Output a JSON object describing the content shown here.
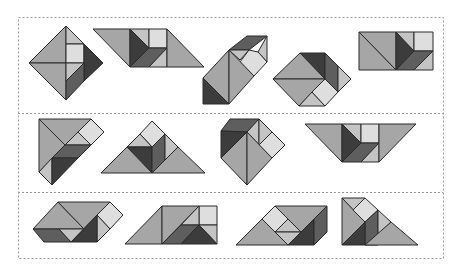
{
  "colors": {
    "background": "#ffffff",
    "frame": "#9a9a9a",
    "outline": "#2a2a2a",
    "mid": "#a6a6a6",
    "light": "#c4c4c4",
    "pale": "#dedede",
    "dark": "#3c3c3c",
    "darkmid": "#5e5e5e"
  },
  "frame": {
    "outer": {
      "x": 18,
      "y": 17,
      "w": 425,
      "h": 241
    },
    "dividers_y": [
      113,
      192
    ]
  },
  "rows": [
    {
      "label": "row-1",
      "figures": [
        {
          "name": "square-diamond",
          "pieces": [
            {
              "c": "mid",
              "p": "29,63 66,26 66,63"
            },
            {
              "c": "mid",
              "p": "29,63 66,63 66,100"
            },
            {
              "c": "light",
              "p": "66,26 84,44 66,44"
            },
            {
              "c": "pale",
              "p": "66,44 84,44 84,63 66,63"
            },
            {
              "c": "dark",
              "p": "84,44 103,63 84,81"
            },
            {
              "c": "light",
              "p": "66,63 84,63 66,81"
            },
            {
              "c": "darkmid",
              "p": "66,81 84,63 84,81 66,100"
            }
          ]
        },
        {
          "name": "parallelogram-wide",
          "pieces": [
            {
              "c": "mid",
              "p": "93,29 130,29 130,67"
            },
            {
              "c": "dark",
              "p": "130,29 149,48 130,67"
            },
            {
              "c": "light",
              "p": "130,29 149,29 149,48"
            },
            {
              "c": "pale",
              "p": "149,29 167,29 167,48 149,48"
            },
            {
              "c": "darkmid",
              "p": "149,48 167,48 149,67 130,67"
            },
            {
              "c": "light",
              "p": "167,48 167,67 149,67"
            },
            {
              "c": "mid",
              "p": "167,29 204,67 167,67"
            }
          ]
        },
        {
          "name": "hexagon-tilted",
          "pieces": [
            {
              "c": "darkmid",
              "p": "229,50 247,36 267,36 249,50"
            },
            {
              "c": "light",
              "p": "267,36 267,62 258,52"
            },
            {
              "c": "light",
              "p": "229,50 249,50 240,60"
            },
            {
              "c": "pale",
              "p": "249,50 258,52 267,62 254,76 240,62"
            },
            {
              "c": "mid",
              "p": "229,50 229,104 203,78"
            },
            {
              "c": "mid",
              "p": "229,50 254,76 229,104"
            },
            {
              "c": "dark",
              "p": "203,78 203,104 229,104"
            }
          ]
        },
        {
          "name": "hexagon-flat",
          "pieces": [
            {
              "c": "dark",
              "p": "300,53 325,53 325,79"
            },
            {
              "c": "mid",
              "p": "300,53 325,79 273,79"
            },
            {
              "c": "darkmid",
              "p": "325,53 338,66 338,92 325,79"
            },
            {
              "c": "light",
              "p": "338,66 351,79 338,92"
            },
            {
              "c": "mid",
              "p": "273,79 325,79 299,106"
            },
            {
              "c": "light",
              "p": "299,106 312,92 325,106"
            },
            {
              "c": "pale",
              "p": "312,92 325,79 338,92 325,106"
            }
          ]
        },
        {
          "name": "rectangle",
          "pieces": [
            {
              "c": "mid",
              "p": "359,32 396,32 396,70"
            },
            {
              "c": "mid",
              "p": "359,32 396,70 359,70"
            },
            {
              "c": "dark",
              "p": "396,32 414,51 396,70"
            },
            {
              "c": "light",
              "p": "396,32 414,32 414,51"
            },
            {
              "c": "pale",
              "p": "414,32 433,32 433,51 414,51"
            },
            {
              "c": "darkmid",
              "p": "414,51 433,51 414,70 396,70"
            },
            {
              "c": "light",
              "p": "433,51 433,70 414,70"
            }
          ]
        }
      ]
    },
    {
      "label": "row-2",
      "figures": [
        {
          "name": "kite-left",
          "pieces": [
            {
              "c": "mid",
              "p": "39,119 91,119 65,145"
            },
            {
              "c": "mid",
              "p": "39,119 65,145 39,172"
            },
            {
              "c": "pale",
              "p": "91,119 104,132 91,145 78,132"
            },
            {
              "c": "light",
              "p": "65,145 78,132 91,145"
            },
            {
              "c": "darkmid",
              "p": "65,145 91,145 78,158 52,158"
            },
            {
              "c": "light",
              "p": "39,172 52,158 52,185"
            },
            {
              "c": "dark",
              "p": "52,158 78,158 52,185"
            }
          ]
        },
        {
          "name": "triangle-house",
          "pieces": [
            {
              "c": "pale",
              "p": "152,121 165,134 152,147 140,134"
            },
            {
              "c": "light",
              "p": "127,147 140,134 152,147"
            },
            {
              "c": "dark",
              "p": "127,147 152,147 152,173"
            },
            {
              "c": "darkmid",
              "p": "152,147 165,134 165,160 152,173"
            },
            {
              "c": "light",
              "p": "165,134 178,147 165,160"
            },
            {
              "c": "mid",
              "p": "101,173 127,147 152,173"
            },
            {
              "c": "mid",
              "p": "152,173 178,147 205,173"
            }
          ]
        },
        {
          "name": "pentagon-gem",
          "pieces": [
            {
              "c": "darkmid",
              "p": "221,131 230,119 259,119 247,132"
            },
            {
              "c": "dark",
              "p": "221,131 247,132 221,158"
            },
            {
              "c": "light",
              "p": "259,119 259,145 247,132"
            },
            {
              "c": "light",
              "p": "259,119 272,132 259,145"
            },
            {
              "c": "pale",
              "p": "259,145 272,132 285,145 272,158"
            },
            {
              "c": "mid",
              "p": "221,158 247,132 247,185"
            },
            {
              "c": "mid",
              "p": "247,132 272,158 247,185"
            }
          ]
        },
        {
          "name": "trapezoid-inverted",
          "pieces": [
            {
              "c": "mid",
              "p": "305,124 342,124 342,162"
            },
            {
              "c": "dark",
              "p": "342,124 361,143 342,162"
            },
            {
              "c": "light",
              "p": "342,124 361,124 361,143"
            },
            {
              "c": "pale",
              "p": "361,124 379,124 379,143 361,143"
            },
            {
              "c": "darkmid",
              "p": "361,143 379,143 361,162 342,162"
            },
            {
              "c": "light",
              "p": "379,143 379,162 361,162"
            },
            {
              "c": "mid",
              "p": "379,124 416,124 379,162"
            }
          ]
        }
      ]
    },
    {
      "label": "row-3",
      "figures": [
        {
          "name": "boat-hexagon",
          "pieces": [
            {
              "c": "mid",
              "p": "33,229 58,202 84,229"
            },
            {
              "c": "mid",
              "p": "58,202 110,202 84,229"
            },
            {
              "c": "pale",
              "p": "110,202 123,215 110,229 97,215"
            },
            {
              "c": "light",
              "p": "97,215 110,229 97,242"
            },
            {
              "c": "darkmid",
              "p": "33,229 59,229 71,242 44,242"
            },
            {
              "c": "light",
              "p": "59,229 84,229 71,242"
            },
            {
              "c": "dark",
              "p": "71,242 97,215 97,242"
            }
          ]
        },
        {
          "name": "trapezoid-right",
          "pieces": [
            {
              "c": "mid",
              "p": "125,244 162,206 162,244"
            },
            {
              "c": "mid",
              "p": "162,206 199,206 162,244"
            },
            {
              "c": "pale",
              "p": "199,206 217,206 217,225 199,225"
            },
            {
              "c": "light",
              "p": "181,225 199,206 199,225"
            },
            {
              "c": "darkmid",
              "p": "162,244 181,225 199,225 181,244"
            },
            {
              "c": "light",
              "p": "199,225 217,225 217,244"
            },
            {
              "c": "dark",
              "p": "181,244 199,225 217,244"
            }
          ]
        },
        {
          "name": "wedge-box",
          "pieces": [
            {
              "c": "pale",
              "p": "275,206 288,219 275,232 262,219"
            },
            {
              "c": "mid",
              "p": "275,206 327,206 301,232 288,219"
            },
            {
              "c": "light",
              "p": "275,232 288,219 301,232"
            },
            {
              "c": "mid",
              "p": "236,245 262,219 288,245"
            },
            {
              "c": "light",
              "p": "275,232 301,232 288,245"
            },
            {
              "c": "dark",
              "p": "288,245 314,219 314,245"
            },
            {
              "c": "darkmid",
              "p": "314,219 327,206 327,232 314,245"
            }
          ]
        },
        {
          "name": "staircase-triangle",
          "pieces": [
            {
              "c": "light",
              "p": "342,198 365,198 353,210"
            },
            {
              "c": "mid",
              "p": "342,198 365,222 342,245"
            },
            {
              "c": "pale",
              "p": "353,210 365,198 378,210 365,222"
            },
            {
              "c": "darkmid",
              "p": "365,222 378,210 378,245 365,245"
            },
            {
              "c": "light",
              "p": "378,210 391,222 378,235"
            },
            {
              "c": "dark",
              "p": "342,245 365,222 365,245"
            },
            {
              "c": "mid",
              "p": "365,245 391,222 418,245"
            }
          ]
        }
      ]
    }
  ]
}
